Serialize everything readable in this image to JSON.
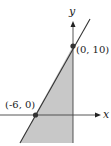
{
  "diagram": {
    "type": "linear-inequality-graph",
    "axes": {
      "x_label": "x",
      "y_label": "y"
    },
    "line": {
      "passes_through": [
        [
          -6,
          0
        ],
        [
          0,
          10
        ]
      ]
    },
    "points": [
      {
        "label": "(0, 10)",
        "x": 0,
        "y": 10
      },
      {
        "label": "(-6, 0)",
        "x": -6,
        "y": 0
      }
    ],
    "shaded_region": {
      "description": "Region bounded on the left by the line and on the right by the y-axis, below (0, 10)",
      "fill_color": "#c8c8c8"
    },
    "colors": {
      "line": "#333333",
      "axes": "#333333",
      "shade": "#c8c8c8",
      "point": "#333333"
    }
  }
}
